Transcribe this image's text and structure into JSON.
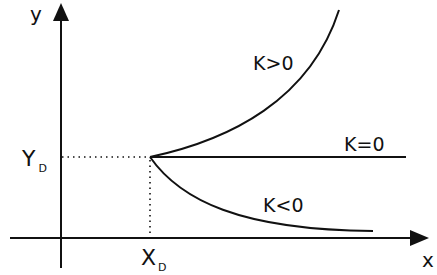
{
  "axes": {
    "x_label": "x",
    "y_label": "y"
  },
  "point": {
    "x_label": "X",
    "x_sub": "D",
    "y_label": "Y",
    "y_sub": "D"
  },
  "curves": [
    {
      "label": "K>0",
      "shape": "increasing, concave up"
    },
    {
      "label": "K=0",
      "shape": "horizontal line"
    },
    {
      "label": "K<0",
      "shape": "decreasing, asymptotic"
    }
  ],
  "colors": {
    "line": "#111111",
    "background": "#ffffff"
  }
}
